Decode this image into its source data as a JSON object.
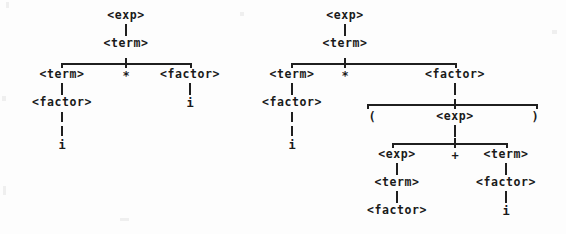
{
  "figure": {
    "title": "",
    "background_color": "#fdfdfd",
    "ink_color": "#1f1f1f"
  },
  "symbols": {
    "exp": "<exp>",
    "term": "<term>",
    "factor": "<factor>",
    "i": "i",
    "times": "*",
    "plus": "+",
    "lparen": "(",
    "rparen": ")"
  },
  "trees": [
    {
      "id": "left-tree",
      "name": "parse-tree-i-times-i",
      "nodes": [
        {
          "id": "L1",
          "label": "<exp>",
          "x": 126,
          "y": 16
        },
        {
          "id": "L2",
          "label": "<term>",
          "x": 126,
          "y": 44
        },
        {
          "id": "L3",
          "label": "<term>",
          "x": 62,
          "y": 75
        },
        {
          "id": "L4",
          "label": "*",
          "x": 126,
          "y": 76
        },
        {
          "id": "L5",
          "label": "<factor>",
          "x": 190,
          "y": 75
        },
        {
          "id": "L6",
          "label": "<factor>",
          "x": 62,
          "y": 103
        },
        {
          "id": "L7",
          "label": "i",
          "x": 190,
          "y": 103
        },
        {
          "id": "L8",
          "label": "i",
          "x": 62,
          "y": 145
        }
      ]
    },
    {
      "id": "right-tree",
      "name": "parse-tree-i-times-paren-i-plus-i",
      "nodes": [
        {
          "id": "R1",
          "label": "<exp>",
          "x": 345,
          "y": 16
        },
        {
          "id": "R2",
          "label": "<term>",
          "x": 345,
          "y": 44
        },
        {
          "id": "R3",
          "label": "<term>",
          "x": 292,
          "y": 75
        },
        {
          "id": "R4",
          "label": "*",
          "x": 345,
          "y": 76
        },
        {
          "id": "R5",
          "label": "<factor>",
          "x": 455,
          "y": 75
        },
        {
          "id": "R6",
          "label": "<factor>",
          "x": 292,
          "y": 103
        },
        {
          "id": "R7",
          "label": "(",
          "x": 372,
          "y": 117
        },
        {
          "id": "R8",
          "label": "<exp>",
          "x": 455,
          "y": 117
        },
        {
          "id": "R9",
          "label": ")",
          "x": 535,
          "y": 117
        },
        {
          "id": "R10",
          "label": "i",
          "x": 292,
          "y": 145
        },
        {
          "id": "R11",
          "label": "<exp>",
          "x": 397,
          "y": 155
        },
        {
          "id": "R12",
          "label": "+",
          "x": 455,
          "y": 156
        },
        {
          "id": "R13",
          "label": "<term>",
          "x": 506,
          "y": 155
        },
        {
          "id": "R14",
          "label": "<term>",
          "x": 397,
          "y": 183
        },
        {
          "id": "R15",
          "label": "<factor>",
          "x": 506,
          "y": 183
        },
        {
          "id": "R16",
          "label": "<factor>",
          "x": 397,
          "y": 211
        },
        {
          "id": "R17",
          "label": "i",
          "x": 506,
          "y": 211
        }
      ]
    }
  ],
  "derivations": {
    "left_expression": "i * i",
    "right_expression": "i * ( i + i )"
  }
}
